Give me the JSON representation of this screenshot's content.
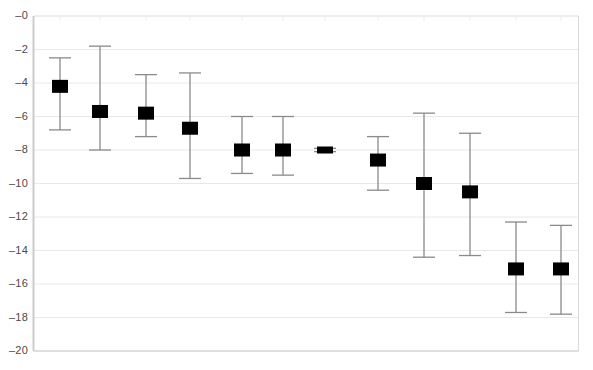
{
  "chart_data": {
    "type": "scatter",
    "title": "",
    "xlabel": "",
    "ylabel": "",
    "ylim": [
      -20,
      0
    ],
    "xlim": [
      0,
      13
    ],
    "grid": true,
    "grid_axis": "y",
    "legend": false,
    "marker": "filled-square",
    "marker_color": "#000000",
    "errorbar_color": "#808080",
    "ytick_labels": [
      "–0",
      "–2",
      "–4",
      "–6",
      "–8",
      "–10",
      "–12",
      "–14",
      "–16",
      "–18",
      "–20"
    ],
    "ytick_values": [
      0,
      -2,
      -4,
      -6,
      -8,
      -10,
      -12,
      -14,
      -16,
      -18,
      -20
    ],
    "xtick_labels": [],
    "x": [
      1,
      2,
      3,
      4,
      5,
      6,
      7,
      8,
      9,
      10,
      11,
      12
    ],
    "values": [
      -4.2,
      -5.7,
      -5.8,
      -6.7,
      -8.0,
      -8.0,
      -8.0,
      -8.6,
      -10.0,
      -10.5,
      -15.1,
      -15.1
    ],
    "error_low": [
      -6.8,
      -8.0,
      -7.2,
      -9.7,
      -9.4,
      -9.5,
      -8.1,
      -10.4,
      -14.4,
      -14.3,
      -17.7,
      -17.8
    ],
    "error_high": [
      -2.5,
      -1.8,
      -3.5,
      -3.4,
      -6.0,
      -6.0,
      -7.9,
      -7.2,
      -5.8,
      -7.0,
      -12.3,
      -12.5
    ],
    "points": [
      {
        "index": 1,
        "value": -4.2,
        "low": -6.8,
        "high": -2.5,
        "px": 60
      },
      {
        "index": 2,
        "value": -5.7,
        "low": -8.0,
        "high": -1.8,
        "px": 100
      },
      {
        "index": 3,
        "value": -5.8,
        "low": -7.2,
        "high": -3.5,
        "px": 146
      },
      {
        "index": 4,
        "value": -6.7,
        "low": -9.7,
        "high": -3.4,
        "px": 190
      },
      {
        "index": 5,
        "value": -8.0,
        "low": -9.4,
        "high": -6.0,
        "px": 242
      },
      {
        "index": 6,
        "value": -8.0,
        "low": -9.5,
        "high": -6.0,
        "px": 283
      },
      {
        "index": 7,
        "value": -8.0,
        "low": -8.1,
        "high": -7.9,
        "px": 325
      },
      {
        "index": 8,
        "value": -8.6,
        "low": -10.4,
        "high": -7.2,
        "px": 378
      },
      {
        "index": 9,
        "value": -10.0,
        "low": -14.4,
        "high": -5.8,
        "px": 424
      },
      {
        "index": 10,
        "value": -10.5,
        "low": -14.3,
        "high": -7.0,
        "px": 470
      },
      {
        "index": 11,
        "value": -15.1,
        "low": -17.7,
        "high": -12.3,
        "px": 516
      },
      {
        "index": 12,
        "value": -15.1,
        "low": -17.8,
        "high": -12.5,
        "px": 561
      }
    ]
  },
  "axis": {
    "top_clipped_text": ""
  },
  "colors": {
    "marker": "#000000",
    "errorbar": "#8a8a8a",
    "gridline": "#e8e8e8",
    "axis": "#cccccc",
    "tick_text": "#4a4a4a"
  }
}
